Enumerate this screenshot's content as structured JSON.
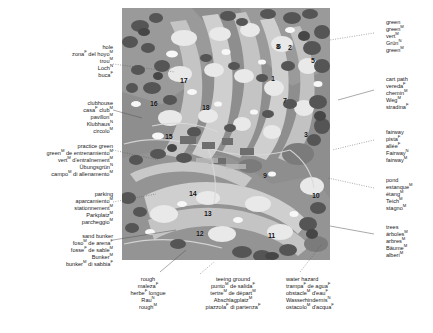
{
  "map": {
    "name": "golf-course-map",
    "hole_numbers": [
      {
        "n": "1",
        "x": 271,
        "y": 75
      },
      {
        "n": "2",
        "x": 288,
        "y": 44
      },
      {
        "n": "3",
        "x": 304,
        "y": 131
      },
      {
        "n": "4",
        "x": 332,
        "y": 106
      },
      {
        "n": "5",
        "x": 311,
        "y": 57
      },
      {
        "n": "6",
        "x": 277,
        "y": 43
      },
      {
        "n": "7",
        "x": 283,
        "y": 97
      },
      {
        "n": "8",
        "x": 276,
        "y": 43
      },
      {
        "n": "9",
        "x": 263,
        "y": 172
      },
      {
        "n": "10",
        "x": 312,
        "y": 192
      },
      {
        "n": "11",
        "x": 268,
        "y": 232
      },
      {
        "n": "12",
        "x": 196,
        "y": 230
      },
      {
        "n": "13",
        "x": 204,
        "y": 210
      },
      {
        "n": "14",
        "x": 189,
        "y": 190
      },
      {
        "n": "15",
        "x": 165,
        "y": 133
      },
      {
        "n": "16",
        "x": 150,
        "y": 100
      },
      {
        "n": "17",
        "x": 180,
        "y": 77
      },
      {
        "n": "18",
        "x": 202,
        "y": 104
      }
    ]
  },
  "labels": {
    "hole": {
      "en": "hole",
      "es": {
        "text": "zona",
        "sup": "F",
        "rest": " del hoyo",
        "sup2": "M"
      },
      "fr": {
        "text": "trou",
        "sup": "M"
      },
      "de": {
        "text": "Loch",
        "sup": "N"
      },
      "it": {
        "text": "buca",
        "sup": "F"
      }
    },
    "clubhouse": {
      "en": "clubhouse",
      "es": {
        "text": "casa",
        "sup": "F",
        "rest": " club",
        "sup2": "M"
      },
      "fr": {
        "text": "pavillon",
        "sup": "M"
      },
      "de": {
        "text": "Klubhaus",
        "sup": "N"
      },
      "it": {
        "text": "circolo",
        "sup": "M"
      }
    },
    "practice_green": {
      "en": "practice green",
      "es": {
        "text": "green",
        "sup": "M",
        "rest": " de entrenamiento",
        "sup2": "M"
      },
      "fr": {
        "text": "vert",
        "sup": "M",
        "rest": " d'entraînement",
        "sup2": "M"
      },
      "de": {
        "text": "Übungsgrün",
        "sup": "N"
      },
      "it": {
        "text": "campo",
        "sup": "M",
        "rest": " di allenamento",
        "sup2": "M"
      }
    },
    "parking": {
      "en": "parking",
      "es": {
        "text": "aparcamiento",
        "sup": "M"
      },
      "fr": {
        "text": "stationnement",
        "sup": "M"
      },
      "de": {
        "text": "Parkplatz",
        "sup": "M"
      },
      "it": {
        "text": "parcheggio",
        "sup": "M"
      }
    },
    "sand_bunker": {
      "en": "sand bunker",
      "es": {
        "text": "foso",
        "sup": "M",
        "rest": " de arena",
        "sup2": "F"
      },
      "fr": {
        "text": "fosse",
        "sup": "F",
        "rest": " de sable",
        "sup2": "M"
      },
      "de": {
        "text": "Bunker",
        "sup": "M"
      },
      "it": {
        "text": "bunker",
        "sup": "M",
        "rest": " di sabbia",
        "sup2": "F"
      }
    },
    "green": {
      "en": "green",
      "es": {
        "text": "green",
        "sup": "M"
      },
      "fr": {
        "text": "vert",
        "sup": "M"
      },
      "de": {
        "text": "Grün",
        "sup": "N"
      },
      "it": {
        "text": "green",
        "sup": "M"
      }
    },
    "cart_path": {
      "en": "cart path",
      "es": {
        "text": "vereda",
        "sup": "F"
      },
      "fr": {
        "text": "chemin",
        "sup": "M"
      },
      "de": {
        "text": "Weg",
        "sup": "M"
      },
      "it": {
        "text": "stradina",
        "sup": "F"
      }
    },
    "fairway": {
      "en": "fairway",
      "es": {
        "text": "pista",
        "sup": "F"
      },
      "fr": {
        "text": "allée",
        "sup": "F"
      },
      "de": {
        "text": "Fairway",
        "sup": "N"
      },
      "it": {
        "text": "fairway",
        "sup": "M"
      }
    },
    "pond": {
      "en": "pond",
      "es": {
        "text": "estanque",
        "sup": "M"
      },
      "fr": {
        "text": "étang",
        "sup": "M"
      },
      "de": {
        "text": "Teich",
        "sup": "M"
      },
      "it": {
        "text": "stagno",
        "sup": "M"
      }
    },
    "trees": {
      "en": "trees",
      "es": {
        "text": "árboles",
        "sup": "M"
      },
      "fr": {
        "text": "arbres",
        "sup": "M"
      },
      "de": {
        "text": "Bäume",
        "sup": "M"
      },
      "it": {
        "text": "alberi",
        "sup": "M"
      }
    },
    "rough": {
      "en": "rough",
      "es": {
        "text": "maleza",
        "sup": "F"
      },
      "fr": {
        "text": "herbe",
        "sup": "F",
        "rest": " longue"
      },
      "de": {
        "text": "Rau",
        "sup": "N"
      },
      "it": {
        "text": "rough",
        "sup": "M"
      }
    },
    "teeing_ground": {
      "en": "teeing ground",
      "es": {
        "text": "punto",
        "sup": "M",
        "rest": " de salida",
        "sup2": "F"
      },
      "fr": {
        "text": "tertre",
        "sup": "M",
        "rest": " de départ",
        "sup2": "M"
      },
      "de": {
        "text": "Abschlagplatz",
        "sup": "M"
      },
      "it": {
        "text": "piazzola",
        "sup": "F",
        "rest": " di partenza",
        "sup2": "F"
      }
    },
    "water_hazard": {
      "en": "water hazard",
      "es": {
        "text": "trampa",
        "sup": "F",
        "rest": " de agua",
        "sup2": "F"
      },
      "fr": {
        "text": "obstacle",
        "sup": "M",
        "rest": " d'eau",
        "sup2": "F"
      },
      "de": {
        "text": "Wasserhindernis",
        "sup": "N"
      },
      "it": {
        "text": "ostacolo",
        "sup": "M",
        "rest": " d'acqua",
        "sup2": "F"
      }
    }
  },
  "colors": {
    "background": "#ffffff",
    "map_base": "#8f8f8f",
    "fairway": "#c9c9c9",
    "green": "#e8e8e8",
    "rough": "#a3a3a3",
    "trees_dark": "#5a5a5a",
    "trees_darker": "#4a4a4a",
    "sand": "#f2f2f2",
    "water": "#7e7e7e",
    "path": "#d8d8d8",
    "text": "#1b1b1b"
  }
}
